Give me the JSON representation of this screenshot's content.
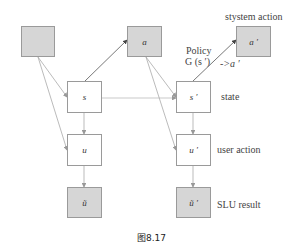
{
  "diagram": {
    "nodes": {
      "prev_action": {
        "label": "",
        "fill": "#d6d6d6"
      },
      "s": {
        "label": "s",
        "fill": "#ffffff"
      },
      "a": {
        "label": "a",
        "fill": "#d6d6d6"
      },
      "u": {
        "label": "u",
        "fill": "#ffffff"
      },
      "u_tilde": {
        "label": "ũ",
        "fill": "#d6d6d6"
      },
      "s_prime": {
        "label": "s ′",
        "fill": "#ffffff"
      },
      "a_prime": {
        "label": "a ′",
        "fill": "#d6d6d6"
      },
      "u_prime": {
        "label": "u ′",
        "fill": "#ffffff"
      },
      "u_tilde_prime": {
        "label": "ũ ′",
        "fill": "#d6d6d6"
      }
    },
    "row_labels": {
      "system_action": "stystem action",
      "state": "state",
      "user_action": "user action",
      "slu_result": "SLU result"
    },
    "policy": {
      "line1": "Policy",
      "line2": "G (s ′)",
      "arrow_text": "->a ′"
    },
    "caption": "图8.17",
    "edges": [
      {
        "from": "prev_action",
        "to": "s"
      },
      {
        "from": "prev_action",
        "to": "u"
      },
      {
        "from": "s",
        "to": "a"
      },
      {
        "from": "s",
        "to": "u"
      },
      {
        "from": "s",
        "to": "s_prime"
      },
      {
        "from": "u",
        "to": "u_tilde"
      },
      {
        "from": "a",
        "to": "s_prime"
      },
      {
        "from": "a",
        "to": "u_prime"
      },
      {
        "from": "s_prime",
        "to": "a_prime"
      },
      {
        "from": "s_prime",
        "to": "u_prime"
      },
      {
        "from": "u_prime",
        "to": "u_tilde_prime"
      }
    ],
    "colors": {
      "box_gray": "#d6d6d6",
      "border": "#9a9a9a",
      "edge_light": "#aaaaaa",
      "edge_dark": "#555555"
    }
  }
}
